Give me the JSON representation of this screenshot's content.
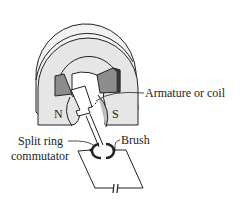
{
  "diagram": {
    "type": "DC motor schematic",
    "labels": {
      "north_pole": "N",
      "south_pole": "S",
      "armature": "Armature or coil",
      "commutator_line1": "Split ring",
      "commutator_line2": "commutator",
      "brush": "Brush"
    },
    "colors": {
      "magnet_face": "#e6e6e6",
      "magnet_back": "#f2f2f2",
      "pole_block": "#8c8c8c",
      "pole_block_dark": "#3a3a3a",
      "coil_shade": "#bdbdbd",
      "stroke": "#222222"
    }
  }
}
